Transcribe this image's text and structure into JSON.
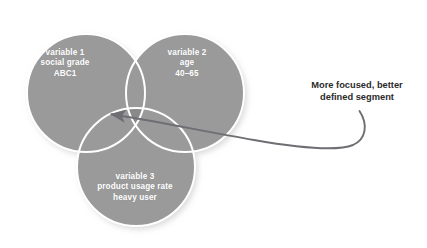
{
  "diagram": {
    "type": "venn-3-circle",
    "title_visible": false,
    "background_color": "#ffffff",
    "circle_fill": "#9a9a9a",
    "circle_stroke": "#ffffff",
    "center_overlap_fill": "#898989",
    "arrow_color": "#6e6e73",
    "annotation_color": "#2b2b2b",
    "label_color": "#ffffff"
  },
  "circles": [
    {
      "id": "variable-1",
      "position": "left",
      "cx": 86,
      "cy": 93,
      "r": 59,
      "lines": [
        "variable 1",
        "social grade",
        "ABC1"
      ],
      "line1": "variable 1",
      "line2": "social grade",
      "line3": "ABC1"
    },
    {
      "id": "variable-2",
      "position": "right",
      "cx": 185,
      "cy": 93,
      "r": 59,
      "lines": [
        "variable 2",
        "age",
        "40–65"
      ],
      "line1": "variable 2",
      "line2": "age",
      "line3": "40–65"
    },
    {
      "id": "variable-3",
      "position": "bottom",
      "cx": 136,
      "cy": 167,
      "r": 59,
      "lines": [
        "variable 3",
        "product usage rate",
        "heavy user"
      ],
      "line1": "variable 3",
      "line2": "product usage rate",
      "line3": "heavy user"
    }
  ],
  "annotation": {
    "line1": "More focused, better",
    "line2": "defined segment",
    "points_to": "center-intersection",
    "arrow_tip": {
      "x": 108,
      "y": 115
    },
    "arrow_tail": {
      "x": 360,
      "y": 112
    }
  }
}
